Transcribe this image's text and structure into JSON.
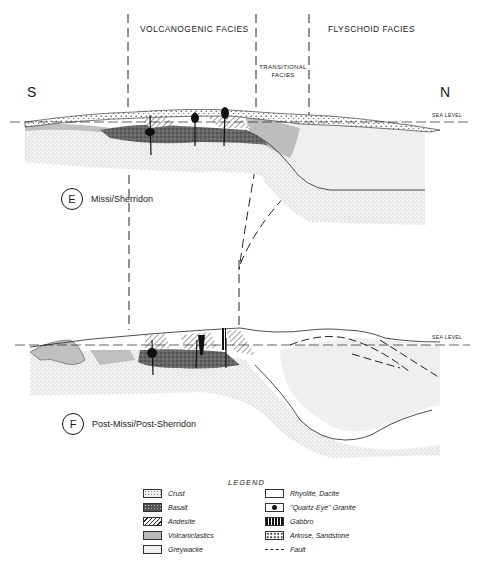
{
  "header": {
    "facies": [
      {
        "label": "VOLCANOGENIC FACIES"
      },
      {
        "label": "TRANSITIONAL",
        "label2": "FACIES"
      },
      {
        "label": "FLYSCHOID FACIES"
      }
    ],
    "south": "S",
    "north": "N"
  },
  "sections": [
    {
      "letter": "E",
      "name": "Missi/Sherridon",
      "sea_level": "SEA LEVEL"
    },
    {
      "letter": "F",
      "name": "Post-Missi/Post-Sherridon",
      "sea_level": "SEA LEVEL"
    }
  ],
  "legend": {
    "title": "LEGEND",
    "left": [
      {
        "label": "Crust",
        "pattern": "fine-stipple"
      },
      {
        "label": "Basalt",
        "pattern": "dark-mottled"
      },
      {
        "label": "Andesite",
        "pattern": "diagonal-hatch"
      },
      {
        "label": "Volcaniclastics",
        "pattern": "grey-fill"
      },
      {
        "label": "Greywacke",
        "pattern": "light-grey"
      }
    ],
    "right": [
      {
        "label": "Rhyolite, Dacite",
        "pattern": "blank"
      },
      {
        "label": "''Quartz-Eye'' Granite",
        "pattern": "black-blob"
      },
      {
        "label": "Gabbro",
        "pattern": "vertical-bars"
      },
      {
        "label": "Arkose, Sandstone",
        "pattern": "coarse-stipple"
      },
      {
        "label": "Fault",
        "pattern": "dashed-line"
      }
    ]
  },
  "colors": {
    "ink": "#1a1a1a",
    "crust": "#e6e6e6",
    "volcaniclastics": "#b8b8b8",
    "greywacke": "#efefef",
    "basalt": "#555555"
  }
}
